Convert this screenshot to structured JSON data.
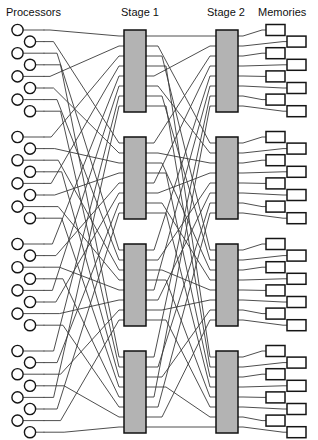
{
  "figure": {
    "width": 318,
    "height": 440,
    "background": "#ffffff"
  },
  "headers": [
    {
      "id": "processors",
      "label": "Processors",
      "x": 6,
      "y": 16,
      "anchor": "start"
    },
    {
      "id": "stage1",
      "label": "Stage 1",
      "x": 121,
      "y": 16,
      "anchor": "start"
    },
    {
      "id": "stage2",
      "label": "Stage 2",
      "x": 207,
      "y": 16,
      "anchor": "start"
    },
    {
      "id": "memories",
      "label": "Memories",
      "x": 258,
      "y": 16,
      "anchor": "start"
    }
  ],
  "style": {
    "switch_fill": "#b3b3b3",
    "switch_stroke": "#101010",
    "wire_color": "#3a3a3a",
    "node_fill": "#ffffff",
    "node_stroke": "#151515",
    "text_color": "#101010"
  },
  "geometry": {
    "group_count": 4,
    "ports_per_group": 8,
    "group_tops": [
      26,
      133,
      240,
      347
    ],
    "port_pitch": 11.6,
    "processor": {
      "radius": 5.6,
      "x_even": 17.5,
      "x_odd": 30.0,
      "stub_end": 44
    },
    "memory": {
      "width": 19,
      "height": 11,
      "x_even": 266,
      "x_odd": 287,
      "stub_start": 258
    },
    "stage1": {
      "x": 124,
      "width": 22,
      "height": 82
    },
    "stage2": {
      "x": 216,
      "width": 22,
      "height": 82
    }
  },
  "switches": {
    "stage1_label": "Stage 1",
    "stage2_label": "Stage 2",
    "stage1_boxes": [
      {
        "id": "s1-0",
        "y": 30
      },
      {
        "id": "s1-1",
        "y": 137
      },
      {
        "id": "s1-2",
        "y": 244
      },
      {
        "id": "s1-3",
        "y": 351
      }
    ],
    "stage2_boxes": [
      {
        "id": "s2-0",
        "y": 30
      },
      {
        "id": "s2-1",
        "y": 137
      },
      {
        "id": "s2-2",
        "y": 244
      },
      {
        "id": "s2-3",
        "y": 351
      }
    ]
  },
  "chart_data": {
    "type": "diagram",
    "columns": [
      "Processors",
      "Stage 1",
      "Stage 2",
      "Memories"
    ],
    "groups": 4,
    "nodes_per_group": 8,
    "total_processors": 32,
    "total_memories": 32,
    "stage1_switches": 4,
    "stage2_switches": 4,
    "processor_to_stage1_permutation": [
      0,
      1,
      2,
      3
    ],
    "stage1_to_stage2_permutation": [
      0,
      1,
      2,
      3
    ]
  }
}
